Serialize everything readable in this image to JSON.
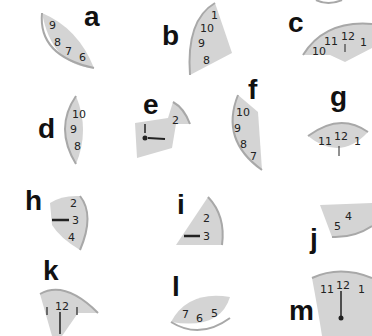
{
  "puzzle": {
    "colors": {
      "piece_fill": "#d4d4d4",
      "piece_rim": "#a8a8a8",
      "text": "#111111",
      "background": "#ffffff"
    },
    "pieces": [
      {
        "label": "a",
        "numbers": [
          "9",
          "8",
          "7",
          "6"
        ]
      },
      {
        "label": "b",
        "numbers": [
          "1",
          "10",
          "9",
          "8"
        ]
      },
      {
        "label": "c",
        "numbers": [
          "10",
          "11",
          "12",
          "1"
        ]
      },
      {
        "label": "d",
        "numbers": [
          "10",
          "9",
          "8"
        ]
      },
      {
        "label": "e",
        "numbers": [
          "2"
        ]
      },
      {
        "label": "f",
        "numbers": [
          "10",
          "9",
          "8",
          "7"
        ]
      },
      {
        "label": "g",
        "numbers": [
          "11",
          "12",
          "1"
        ]
      },
      {
        "label": "h",
        "numbers": [
          "2",
          "3",
          "4"
        ]
      },
      {
        "label": "i",
        "numbers": [
          "2",
          "3"
        ]
      },
      {
        "label": "j",
        "numbers": [
          "5",
          "4"
        ]
      },
      {
        "label": "k",
        "numbers": [
          "1",
          "12",
          "1"
        ]
      },
      {
        "label": "l",
        "numbers": [
          "7",
          "6",
          "5"
        ]
      },
      {
        "label": "m",
        "numbers": [
          "11",
          "12",
          "1"
        ]
      }
    ]
  }
}
